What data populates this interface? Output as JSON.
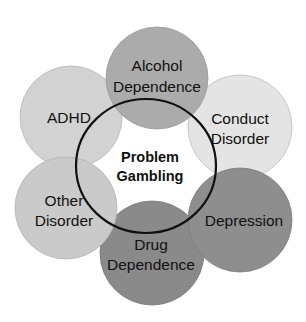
{
  "diagram": {
    "center": {
      "label_line1": "Problem",
      "label_line2": "Gambling",
      "stroke": "#111111"
    },
    "nodes": [
      {
        "id": "adhd",
        "line1": "ADHD",
        "line2": "",
        "color": "#d2d2d2"
      },
      {
        "id": "conduct",
        "line1": "Conduct",
        "line2": "Disorder",
        "color": "#e4e4e4"
      },
      {
        "id": "drug",
        "line1": "Drug",
        "line2": "Dependence",
        "color": "#8a8a8a"
      },
      {
        "id": "alcohol",
        "line1": "Alcohol",
        "line2": "Dependence",
        "color": "#ababab"
      },
      {
        "id": "other",
        "line1": "Other",
        "line2": "Disorder",
        "color": "#cacaca"
      },
      {
        "id": "depression",
        "line1": "Depression",
        "line2": "",
        "color": "#8e8e8e"
      }
    ]
  }
}
